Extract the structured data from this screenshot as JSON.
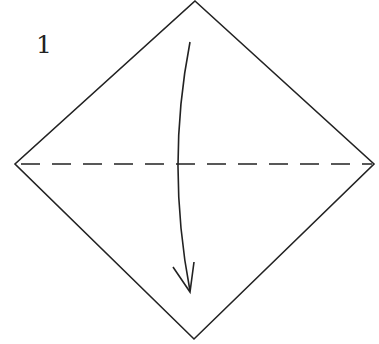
{
  "step": {
    "number": "1"
  },
  "diagram": {
    "stroke_color": "#222222",
    "background_color": "#ffffff",
    "square": {
      "top": [
        195,
        1
      ],
      "right": [
        374,
        164
      ],
      "bottom": [
        194,
        339
      ],
      "left": [
        15,
        164
      ]
    },
    "fold_line": {
      "type": "valley-fold-dashed",
      "from": [
        15,
        164
      ],
      "to": [
        374,
        164
      ],
      "dash": "19 12"
    },
    "arrow": {
      "direction": "down",
      "start": [
        191,
        40
      ],
      "tip": [
        190,
        292
      ]
    }
  }
}
